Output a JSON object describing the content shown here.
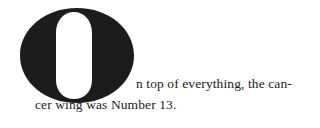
{
  "dropcap": {
    "letter": "O"
  },
  "paragraph": {
    "line1": "n top of everything, the can-",
    "line2": "cer wing was Number 13."
  }
}
